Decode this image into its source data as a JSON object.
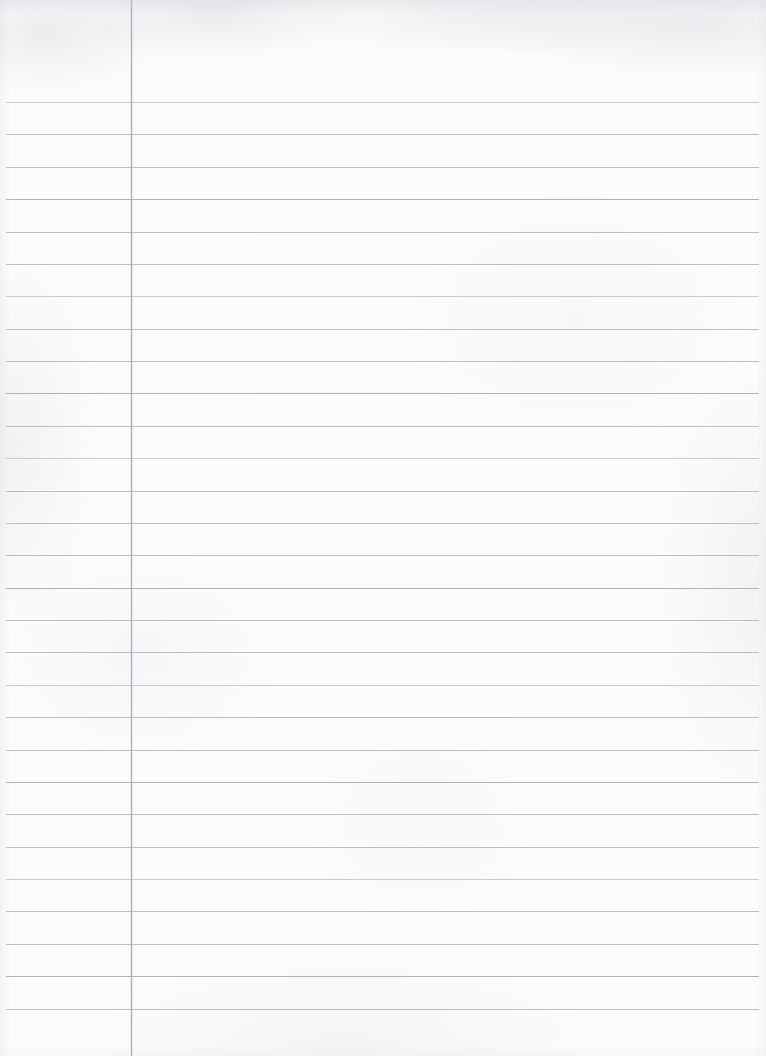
{
  "document": {
    "kind": "ruled-notebook-page",
    "title": "Blank ruled notebook page",
    "description": "Scanned blank lined writing paper with a vertical left margin rule and horizontal ruled writing lines. No handwriting, printed text, headings, page numbers or annotations are present.",
    "orientation": "portrait",
    "page_width_px": 766,
    "page_height_px": 1056,
    "body_text": "",
    "visible_text_items": []
  },
  "paper": {
    "background_color": "#fcfcfd",
    "texture": "light scan mottling, no visible fibres or folds",
    "edge_shading_color": "#cdd0d6"
  },
  "margin_rule": {
    "label": "left vertical margin line",
    "color": "#aeb3bb",
    "x_px": 131,
    "width_px": 1,
    "top_px": 0,
    "bottom_px": 1056,
    "full_height": true
  },
  "ruling": {
    "label": "horizontal writing lines",
    "color": "#b9bdc5",
    "color_faint": "#c7cad1",
    "color_strong": "#aeb2bb",
    "line_thickness_px": 1,
    "first_line_y_px": 102,
    "last_line_y_px": 1008,
    "spacing_px": 32.36,
    "line_count": 29,
    "x_start_px": 6,
    "x_end_px": 759,
    "header_space_above_first_line_px": 102,
    "lines_y": [
      102,
      134.4,
      166.8,
      199.1,
      231.5,
      263.9,
      296.3,
      328.6,
      361.0,
      393.4,
      425.8,
      458.1,
      490.5,
      522.9,
      555.3,
      587.6,
      620.0,
      652.4,
      684.8,
      717.1,
      749.5,
      781.9,
      814.3,
      846.6,
      879.0,
      911.4,
      943.8,
      976.1,
      1008.5
    ],
    "line_weights": [
      "faint",
      "normal",
      "normal",
      "strong",
      "normal",
      "normal",
      "faint",
      "normal",
      "normal",
      "strong",
      "normal",
      "faint",
      "normal",
      "normal",
      "normal",
      "strong",
      "normal",
      "normal",
      "faint",
      "normal",
      "normal",
      "strong",
      "normal",
      "normal",
      "faint",
      "normal",
      "normal",
      "strong",
      "normal"
    ]
  }
}
